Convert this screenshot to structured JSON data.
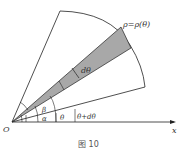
{
  "diagram": {
    "curve_label": "ρ=ρ(θ)",
    "dtheta_label": "dθ",
    "beta_label": "β",
    "alpha_label": "α",
    "theta_label": "θ",
    "theta_dtheta_label": "θ+dθ",
    "origin_label": "O",
    "x_axis_label": "x",
    "caption": "图 10"
  },
  "colors": {
    "line": "#222222",
    "shade": "#a8a8a8"
  }
}
